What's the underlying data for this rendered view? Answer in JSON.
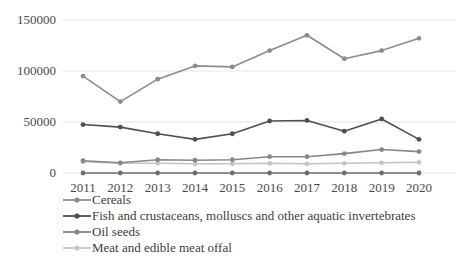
{
  "chart_data": {
    "type": "line",
    "title": "",
    "xlabel": "",
    "ylabel": "",
    "categories": [
      "2011",
      "2012",
      "2013",
      "2014",
      "2015",
      "2016",
      "2017",
      "2018",
      "2019",
      "2020"
    ],
    "x_tick_labels": [
      "2011",
      "2012",
      "2013",
      "2014",
      "2015",
      "2016",
      "2017",
      "2018",
      "2019",
      "2020"
    ],
    "y_tick_labels": [
      "0",
      "50000",
      "100000",
      "150000"
    ],
    "y_tick_values": [
      0,
      50000,
      100000,
      150000
    ],
    "ylim": [
      0,
      150000
    ],
    "grid": true,
    "grid_axis": "y",
    "legend_position": "bottom-left",
    "series": [
      {
        "name": "Cereals",
        "color": "#8c8c8c",
        "values": [
          95000,
          70000,
          92000,
          105000,
          104000,
          120000,
          135000,
          112000,
          120000,
          132000
        ]
      },
      {
        "name": "Fish and crustaceans, molluscs and other aquatic invertebrates",
        "color": "#4f4f4f",
        "values": [
          47500,
          45000,
          38500,
          33000,
          38500,
          51000,
          51500,
          41000,
          53000,
          33000
        ]
      },
      {
        "name": "Oil seeds",
        "color": "#878787",
        "values": [
          12000,
          10000,
          13000,
          12500,
          13000,
          16000,
          16000,
          19000,
          23000,
          21000
        ]
      },
      {
        "name": "Meat and edible meat offal",
        "color": "#c4c4c4",
        "values": [
          11000,
          9500,
          9500,
          9000,
          9000,
          9500,
          9000,
          9500,
          10000,
          10500
        ]
      }
    ],
    "baseline_series": {
      "name": "axis-baseline",
      "color": "#6e6e6e",
      "values": [
        0,
        0,
        0,
        0,
        0,
        0,
        0,
        0,
        0,
        0
      ]
    },
    "colors": {
      "gridline": "#e6e6e6",
      "tick_text": "#4a4a4a",
      "legend_text": "#3d3d3d",
      "background": "#ffffff"
    }
  },
  "legend": {
    "items": [
      {
        "label": "Cereals"
      },
      {
        "label": "Fish and crustaceans, molluscs and other aquatic invertebrates"
      },
      {
        "label": "Oil seeds"
      },
      {
        "label": "Meat and edible meat offal"
      }
    ]
  }
}
